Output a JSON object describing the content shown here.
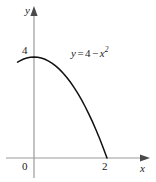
{
  "figure": {
    "background_color": "#ffffff",
    "axis_color": "#9a9a9a",
    "curve_color": "#111111",
    "text_color": "#1a1a1a"
  },
  "labels": {
    "y_axis": "y",
    "x_axis": "x",
    "origin": "0",
    "y_tick_4": "4",
    "x_tick_2": "2"
  },
  "equation": {
    "lhs": "y",
    "equals": "=",
    "constant": "4",
    "minus": "−",
    "variable": "x",
    "exponent": "2",
    "full_text": "y = 4 − x²"
  },
  "chart_data": {
    "type": "line",
    "title": "",
    "xlabel": "x",
    "ylabel": "y",
    "function": "y = 4 - x^2",
    "xlim": [
      -0.45,
      2.3
    ],
    "ylim": [
      -0.6,
      4.7
    ],
    "xticks": [
      0,
      2
    ],
    "xtick_labels": [
      "0",
      "2"
    ],
    "yticks": [
      4
    ],
    "ytick_labels": [
      "4"
    ],
    "grid": false,
    "legend": "none",
    "annotations": [
      {
        "text": "y = 4 − x²",
        "x": 0.95,
        "y": 3.55
      }
    ],
    "series": [
      {
        "name": "y = 4 - x^2",
        "x": [
          -0.45,
          -0.4,
          -0.3,
          -0.2,
          -0.1,
          0.0,
          0.1,
          0.2,
          0.3,
          0.4,
          0.5,
          0.6,
          0.7,
          0.8,
          0.9,
          1.0,
          1.1,
          1.2,
          1.3,
          1.4,
          1.5,
          1.6,
          1.7,
          1.8,
          1.9,
          2.0
        ],
        "y": [
          3.7975,
          3.84,
          3.91,
          3.96,
          3.99,
          4.0,
          3.99,
          3.96,
          3.91,
          3.84,
          3.75,
          3.64,
          3.51,
          3.36,
          3.19,
          3.0,
          2.79,
          2.56,
          2.31,
          2.04,
          1.75,
          1.44,
          1.11,
          0.76,
          0.39,
          0.0
        ]
      }
    ]
  }
}
